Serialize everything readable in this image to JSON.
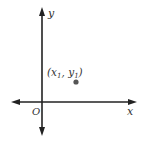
{
  "diagram": {
    "type": "coordinate-plane",
    "axes": {
      "x_label": "x",
      "y_label": "y",
      "origin_label": "O"
    },
    "point": {
      "label_open": "(",
      "x_var": "x",
      "x_sub": "1",
      "sep": ", ",
      "y_var": "y",
      "y_sub": "1",
      "label_close": ")"
    },
    "colors": {
      "axis": "#222222",
      "point": "#555555",
      "text": "#333333"
    }
  }
}
